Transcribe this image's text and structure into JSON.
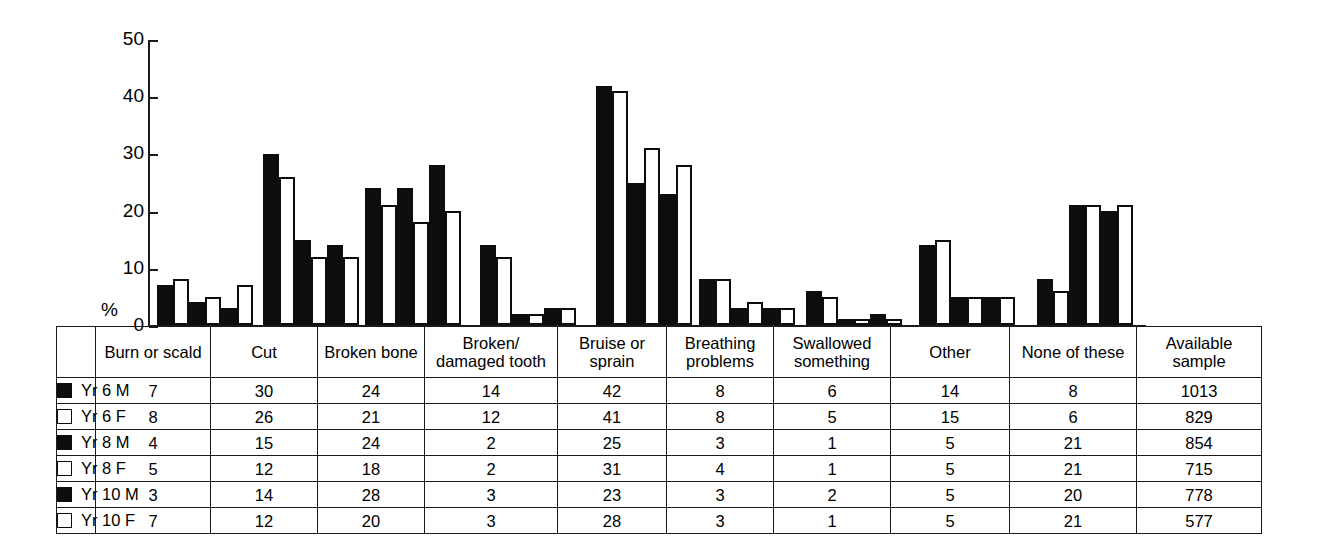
{
  "chart_data": {
    "type": "bar",
    "title": "",
    "xlabel": "",
    "ylabel": "%",
    "ylim": [
      0,
      50
    ],
    "yticks": [
      0,
      10,
      20,
      30,
      40,
      50
    ],
    "grid": false,
    "legend_position": "table-left-column",
    "categories": [
      "Burn or scald",
      "Cut",
      "Broken bone",
      "Broken/ damaged tooth",
      "Bruise or sprain",
      "Breathing problems",
      "Swallowed something",
      "Other",
      "None of these"
    ],
    "series": [
      {
        "name": "Yr 6 M",
        "marker": "filled",
        "values": [
          7,
          30,
          24,
          14,
          42,
          8,
          6,
          14,
          8
        ],
        "sample": 1013
      },
      {
        "name": "Yr 6 F",
        "marker": "open",
        "values": [
          8,
          26,
          21,
          12,
          41,
          8,
          5,
          15,
          6
        ],
        "sample": 829
      },
      {
        "name": "Yr 8 M",
        "marker": "filled",
        "values": [
          4,
          15,
          24,
          2,
          25,
          3,
          1,
          5,
          21
        ],
        "sample": 854
      },
      {
        "name": "Yr 8 F",
        "marker": "open",
        "values": [
          5,
          12,
          18,
          2,
          31,
          4,
          1,
          5,
          21
        ],
        "sample": 715
      },
      {
        "name": "Yr 10 M",
        "marker": "filled",
        "values": [
          3,
          14,
          28,
          3,
          23,
          3,
          2,
          5,
          20
        ],
        "sample": 778
      },
      {
        "name": "Yr 10 F",
        "marker": "open",
        "values": [
          7,
          12,
          20,
          3,
          28,
          3,
          1,
          5,
          21
        ],
        "sample": 577
      }
    ],
    "available_sample_label": "Available sample"
  },
  "axis": {
    "y_title": "%",
    "tick_labels": [
      "50",
      "40",
      "30",
      "20",
      "10",
      "0"
    ]
  },
  "table": {
    "headers": [
      "",
      "Burn or scald",
      "Cut",
      "Broken bone",
      "Broken/ damaged tooth",
      "Bruise or sprain",
      "Breathing problems",
      "Swallowed something",
      "Other",
      "None of these",
      "Available sample"
    ],
    "rows": [
      {
        "legend": "Yr 6 M",
        "marker": "filled",
        "cells": [
          "7",
          "30",
          "24",
          "14",
          "42",
          "8",
          "6",
          "14",
          "8",
          "1013"
        ]
      },
      {
        "legend": "Yr 6 F",
        "marker": "open",
        "cells": [
          "8",
          "26",
          "21",
          "12",
          "41",
          "8",
          "5",
          "15",
          "6",
          "829"
        ]
      },
      {
        "legend": "Yr 8 M",
        "marker": "filled",
        "cells": [
          "4",
          "15",
          "24",
          "2",
          "25",
          "3",
          "1",
          "5",
          "21",
          "854"
        ]
      },
      {
        "legend": "Yr 8 F",
        "marker": "open",
        "cells": [
          "5",
          "12",
          "18",
          "2",
          "31",
          "4",
          "1",
          "5",
          "21",
          "715"
        ]
      },
      {
        "legend": "Yr 10 M",
        "marker": "filled",
        "cells": [
          "3",
          "14",
          "28",
          "3",
          "23",
          "3",
          "2",
          "5",
          "20",
          "778"
        ]
      },
      {
        "legend": "Yr 10 F",
        "marker": "open",
        "cells": [
          "7",
          "12",
          "20",
          "3",
          "28",
          "3",
          "1",
          "5",
          "21",
          "577"
        ]
      }
    ]
  },
  "colors": {
    "male_fill": "#0d0d0d",
    "female_fill": "#ffffff",
    "stroke": "#1a1a1a"
  }
}
